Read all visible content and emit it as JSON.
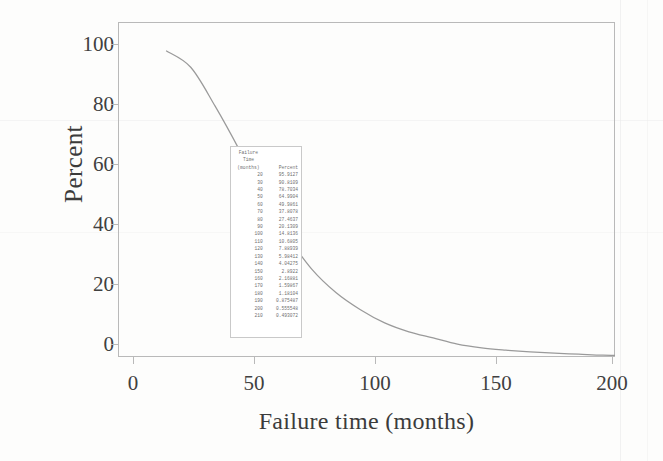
{
  "chart_data": {
    "type": "line",
    "title": "",
    "xlabel": "Failure time (months)",
    "ylabel": "Percent",
    "xlim": [
      0,
      205
    ],
    "ylim": [
      0,
      105
    ],
    "xticks": [
      "0",
      "50",
      "100",
      "150",
      "200"
    ],
    "xtick_values": [
      0,
      50,
      100,
      150,
      200
    ],
    "yticks": [
      "0",
      "20",
      "40",
      "60",
      "80",
      "100"
    ],
    "ytick_values": [
      0,
      20,
      40,
      60,
      80,
      100
    ],
    "grid": false,
    "legend": "none",
    "series": [
      {
        "name": "Percent surviving",
        "x": [
          20,
          30,
          40,
          50,
          60,
          70,
          80,
          90,
          100,
          110,
          120,
          130,
          140,
          150,
          160,
          170,
          180,
          190,
          200,
          210
        ],
        "values": [
          95.9127,
          90.8109,
          78.7034,
          64.9904,
          49.9861,
          37.8078,
          27.4637,
          20.1309,
          14.8136,
          10.6805,
          7.88939,
          5.98412,
          4.04275,
          2.8922,
          2.16881,
          1.59867,
          1.18104,
          0.875487,
          0.555548,
          0.493072
        ]
      }
    ]
  },
  "inset_table": {
    "header_line_1": "Failure",
    "header_line_2": "Time",
    "header_col_1": "(months)",
    "header_col_2": "Percent",
    "rows": [
      {
        "time": "20",
        "percent": "95.9127"
      },
      {
        "time": "30",
        "percent": "90.8109"
      },
      {
        "time": "40",
        "percent": "78.7034"
      },
      {
        "time": "50",
        "percent": "64.9904"
      },
      {
        "time": "60",
        "percent": "49.9861"
      },
      {
        "time": "70",
        "percent": "37.8078"
      },
      {
        "time": "80",
        "percent": "27.4637"
      },
      {
        "time": "90",
        "percent": "20.1309"
      },
      {
        "time": "100",
        "percent": "14.8136"
      },
      {
        "time": "110",
        "percent": "10.6805"
      },
      {
        "time": "120",
        "percent": "7.88939"
      },
      {
        "time": "130",
        "percent": "5.98412"
      },
      {
        "time": "140",
        "percent": "4.04275"
      },
      {
        "time": "150",
        "percent": "2.8922"
      },
      {
        "time": "160",
        "percent": "2.16881"
      },
      {
        "time": "170",
        "percent": "1.59867"
      },
      {
        "time": "180",
        "percent": "1.18104"
      },
      {
        "time": "190",
        "percent": "0.875487"
      },
      {
        "time": "200",
        "percent": "0.555548"
      },
      {
        "time": "210",
        "percent": "0.493072"
      }
    ]
  },
  "colors": {
    "curve": "#9a9a9a",
    "frame": "#b9b9b9",
    "text": "#3a3a3a",
    "table_text": "#6f6f6f",
    "page": "#fdfdfc"
  }
}
